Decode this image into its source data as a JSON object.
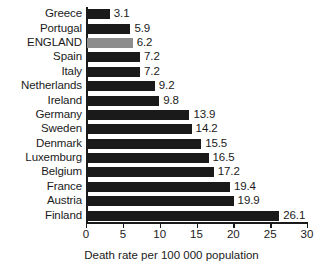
{
  "chart_data": {
    "type": "bar",
    "orientation": "horizontal",
    "title": "",
    "subtitle": "",
    "xlabel": "Death rate per 100 000 population",
    "ylabel": "",
    "xlim": [
      0,
      30
    ],
    "xticks": [
      0,
      5,
      10,
      15,
      20,
      25,
      30
    ],
    "xtick_labels": [
      "0",
      "5",
      "10",
      "15",
      "20",
      "25",
      "30"
    ],
    "grid": false,
    "legend": null,
    "categories": [
      "Greece",
      "Portugal",
      "ENGLAND",
      "Spain",
      "Italy",
      "Netherlands",
      "Ireland",
      "Germany",
      "Sweden",
      "Denmark",
      "Luxemburg",
      "Belgium",
      "France",
      "Austria",
      "Finland"
    ],
    "values": [
      3.1,
      5.9,
      6.2,
      7.2,
      7.2,
      9.2,
      9.8,
      13.9,
      14.2,
      15.5,
      16.5,
      17.2,
      19.4,
      19.9,
      26.1
    ],
    "value_labels": [
      "3.1",
      "5.9",
      "6.2",
      "7.2",
      "7.2",
      "9.2",
      "9.8",
      "13.9",
      "14.2",
      "15.5",
      "16.5",
      "17.2",
      "19.4",
      "19.9",
      "26.1"
    ],
    "highlight_category": "ENGLAND",
    "colors": {
      "bar": "#1a1a1a",
      "bar_highlight": "#8d8d8d",
      "axis": "#1a1a1a",
      "text": "#1a1a1a",
      "background": "#ffffff"
    }
  }
}
